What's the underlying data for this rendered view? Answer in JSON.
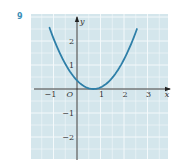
{
  "question_number": "9",
  "colors": {
    "panel": "#d4e6ec",
    "grid": "#f4f9fb",
    "curve": "#2e7fa8",
    "axis": "#222222",
    "qnum": "#3a8fb8"
  },
  "chart_data": {
    "type": "line",
    "title": "",
    "xlabel": "x",
    "ylabel": "y",
    "origin_label": "O",
    "xlim": [
      -1.9,
      3.8
    ],
    "ylim": [
      -2.9,
      2.9
    ],
    "grid": true,
    "xticks": [
      {
        "v": -1,
        "label": "−1"
      },
      {
        "v": 1,
        "label": "1"
      },
      {
        "v": 2,
        "label": "2"
      },
      {
        "v": 3,
        "label": "3"
      }
    ],
    "yticks": [
      {
        "v": 2,
        "label": "2"
      },
      {
        "v": 1,
        "label": "1"
      },
      {
        "v": -1,
        "label": "−1"
      },
      {
        "v": -2,
        "label": "−2"
      }
    ],
    "series": [
      {
        "name": "parabola",
        "function": "y = 0.73(x - 0.7)^2",
        "x": [
          -1.17,
          -1.0,
          -0.5,
          0.0,
          0.3,
          0.7,
          1.1,
          1.5,
          2.0,
          2.3,
          2.55
        ],
        "y": [
          2.55,
          2.11,
          1.05,
          0.36,
          0.12,
          0.0,
          0.12,
          0.47,
          1.23,
          1.87,
          2.5
        ]
      }
    ]
  }
}
